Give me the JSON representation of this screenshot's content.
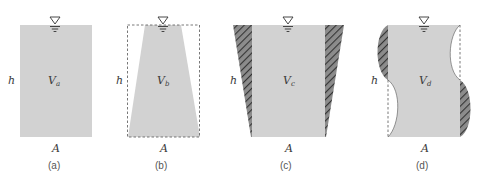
{
  "colors": {
    "fill": "#d2d2d2",
    "hatch_bg": "#9a9a9a",
    "hatch_line": "#3a3a3a",
    "stroke": "#444444",
    "dash": "#555555"
  },
  "labels": {
    "height": "h",
    "area": "A",
    "volume": "V"
  },
  "panels": [
    {
      "id": "a",
      "caption": "(a)",
      "volume_sub": "a"
    },
    {
      "id": "b",
      "caption": "(b)",
      "volume_sub": "b"
    },
    {
      "id": "c",
      "caption": "(c)",
      "volume_sub": "c"
    },
    {
      "id": "d",
      "caption": "(d)",
      "volume_sub": "d"
    }
  ]
}
